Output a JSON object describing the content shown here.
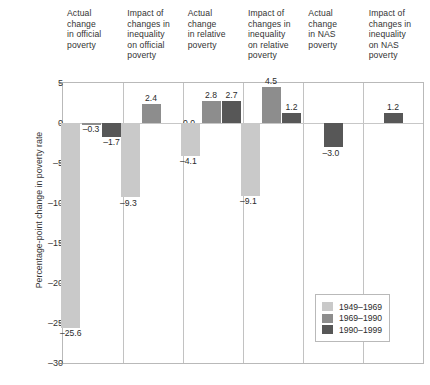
{
  "chart_data": {
    "type": "bar",
    "title": "",
    "subtitle": "",
    "xlabel": "",
    "ylabel": "Percentage-point change in poverty rate",
    "ylim": [
      -30,
      5
    ],
    "yticks": [
      5,
      0,
      -5,
      -10,
      -15,
      -20,
      -25,
      -30
    ],
    "ytick_labels": [
      "5",
      "0",
      "–5",
      "–10",
      "–15",
      "–20",
      "–25",
      "–30"
    ],
    "grid": false,
    "legend_position": "bottom-right",
    "categories": [
      "Actual change in official poverty",
      "Impact of changes in inequality on official poverty",
      "Actual change in relative poverty",
      "Impact of changes in inequality on relative poverty",
      "Actual change in NAS poverty",
      "Impact of changes in inequality on NAS poverty"
    ],
    "series": [
      {
        "name": "1949–1969",
        "color": "#c9c9c9",
        "values": [
          -25.6,
          -9.3,
          -4.1,
          -9.1,
          null,
          null
        ],
        "labels": [
          "–25.6",
          "–9.3",
          "–4.1",
          "–9.1",
          "",
          ""
        ]
      },
      {
        "name": "1969–1990",
        "color": "#8d8d8d",
        "values": [
          -0.3,
          2.4,
          2.8,
          4.5,
          null,
          null
        ],
        "labels": [
          "–0.3",
          "2.4",
          "2.8",
          "4.5",
          "",
          ""
        ]
      },
      {
        "name": "1990–1999",
        "color": "#575757",
        "values": [
          -1.7,
          0.0,
          2.7,
          1.2,
          -3.0,
          1.2
        ],
        "labels": [
          "–1.7",
          "0.0",
          "2.7",
          "1.2",
          "–3.0",
          "1.2"
        ]
      }
    ]
  },
  "headers": [
    [
      "Actual",
      "change",
      "in official",
      "poverty"
    ],
    [
      "Impact of",
      "changes in",
      "inequality",
      "on official",
      "poverty"
    ],
    [
      "Actual",
      "change",
      "in relative",
      "poverty"
    ],
    [
      "Impact of",
      "changes in",
      "inequality",
      "on relative",
      "poverty"
    ],
    [
      "Actual",
      "change",
      "in NAS",
      "poverty"
    ],
    [
      "Impact of",
      "changes in",
      "inequality",
      "on NAS",
      "poverty"
    ]
  ],
  "axis": {
    "y_title": "Percentage-point change in poverty rate"
  },
  "legend": {
    "entries": [
      {
        "label": "1949–1969",
        "color": "#c9c9c9"
      },
      {
        "label": "1969–1990",
        "color": "#8d8d8d"
      },
      {
        "label": "1990–1999",
        "color": "#575757"
      }
    ]
  },
  "caption": {
    "text": ""
  },
  "colors": {
    "series1": "#c9c9c9",
    "series2": "#8d8d8d",
    "series3": "#575757",
    "axis": "#b9b9b9",
    "text": "#2b2b2b"
  }
}
